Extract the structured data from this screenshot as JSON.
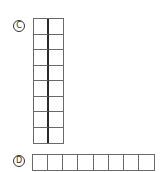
{
  "figure": {
    "part_c": {
      "label": "C",
      "shape": "vertical-grid",
      "columns": 2,
      "rows": 8,
      "divider": "thick-center-line"
    },
    "part_d": {
      "label": "D",
      "shape": "horizontal-strip",
      "columns": 8,
      "rows": 1
    },
    "colors": {
      "grid_line": "#6a6a6a",
      "center_line": "#2a2a2a",
      "label_ink": "#333333",
      "background": "#ffffff"
    }
  }
}
